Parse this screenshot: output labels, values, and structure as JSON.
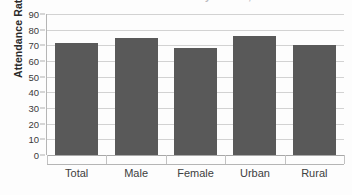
{
  "chart_data": {
    "type": "bar",
    "title": "",
    "xlabel": "",
    "ylabel": "Attendance Rate (%)",
    "categories": [
      "Total",
      "Male",
      "Female",
      "Urban",
      "Rural"
    ],
    "values": [
      71.5,
      75,
      68,
      76,
      70
    ],
    "series": [
      {
        "name": "Attendance Rate",
        "values": [
          71.5,
          75,
          68,
          76,
          70
        ],
        "color": "#595959"
      }
    ],
    "ylim": [
      0,
      90
    ],
    "ytick_step": 10,
    "yticks": [
      "90",
      "80",
      "70",
      "60",
      "50",
      "40",
      "30",
      "20",
      "10",
      "0"
    ],
    "ytick_values": [
      90,
      80,
      70,
      60,
      50,
      40,
      30,
      20,
      10,
      0
    ],
    "grid": true,
    "grid_axis": "y",
    "legend": false,
    "legend_position": "none",
    "bar_color": "#595959",
    "gridline_color": "#d2d2d2",
    "axis_color": "#b5b5b5"
  },
  "title_strip": {
    "text": "Attendance Rate in Primary School, 2010",
    "note": "clipped"
  }
}
